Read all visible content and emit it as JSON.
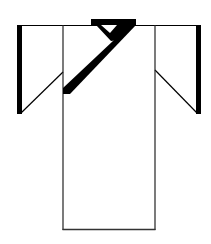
{
  "figure": {
    "colors": {
      "background": "#ffffff",
      "stroke": "#000000",
      "hem_stroke": "#333333"
    }
  }
}
